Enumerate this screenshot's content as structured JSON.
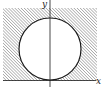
{
  "figure": {
    "axes": {
      "x_label": "x",
      "y_label": "y"
    },
    "region": {
      "shape": "square",
      "fill": "diagonal-hatch",
      "excluded": "circle"
    },
    "colors": {
      "stroke": "#1a1a1a",
      "hatch": "#8a8a8a",
      "background": "#ffffff"
    }
  }
}
